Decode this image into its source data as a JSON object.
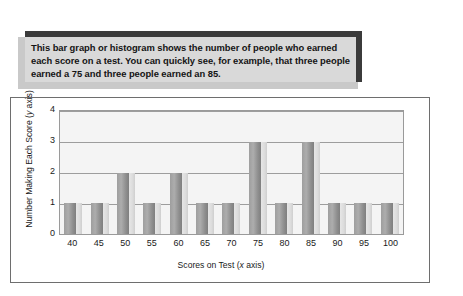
{
  "caption": {
    "text": "This bar graph or histogram shows the number of people who earned each score on a test. You can quickly see, for example, that three people earned a 75 and three people earned an 85."
  },
  "chart_data": {
    "type": "bar",
    "title": "",
    "subtitle": "",
    "xlabel_prefix": "Scores on Test (",
    "xlabel_italic": "x",
    "xlabel_suffix": " axis)",
    "ylabel_prefix": "Number Making Each Score (",
    "ylabel_italic": "y",
    "ylabel_suffix": " axis)",
    "categories": [
      "40",
      "45",
      "50",
      "55",
      "60",
      "65",
      "70",
      "75",
      "80",
      "85",
      "90",
      "95",
      "100"
    ],
    "values": [
      1,
      1,
      2,
      1,
      2,
      1,
      1,
      3,
      1,
      3,
      1,
      1,
      1
    ],
    "yticks": [
      "4",
      "3",
      "2",
      "1",
      "0"
    ],
    "ylim": [
      0,
      4
    ],
    "grid": true,
    "legend": "none",
    "bar_color": "#9e9e9e",
    "bar_side_color": "#dcdcdc",
    "plot_background": "#f4f4f4",
    "gridline_color": "#9d9d9d"
  },
  "colors": {
    "caption_background": "#d9d9d9",
    "caption_accent": "#3b3b3b",
    "caption_shadow": "#c9c9c9",
    "frame_border": "#6e6e6e",
    "page_background": "#ffffff"
  }
}
